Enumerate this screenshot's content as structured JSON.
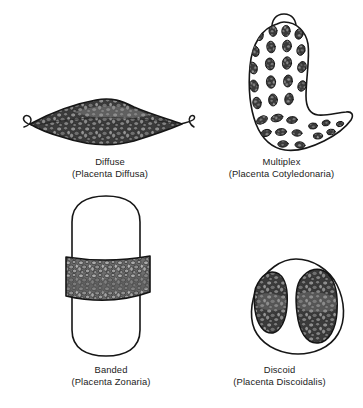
{
  "figure": {
    "title": "",
    "background_color": "#ffffff",
    "line_color": "#1a1a1a",
    "tissue_dark_color": "#2f2f2f",
    "tissue_mid_color": "#6e6e6e",
    "tissue_light_color": "#9a9a9a",
    "panels": [
      {
        "id": "diffuse",
        "name": "Diffuse",
        "latin": "(Placenta Diffusa)",
        "shape": "lens-spindle-fully-villous",
        "villous_coverage": "entire surface"
      },
      {
        "id": "multiplex",
        "name": "Multiplex",
        "latin": "(Placenta Cotyledonaria)",
        "shape": "curved-comma-with-apical-knob",
        "villous_coverage": "multiple scattered cotyledons"
      },
      {
        "id": "banded",
        "name": "Banded",
        "latin": "(Placenta Zonaria)",
        "shape": "vertical-capsule-with-equatorial-band",
        "villous_coverage": "single transverse band"
      },
      {
        "id": "discoid",
        "name": "Discoid",
        "latin": "(Placenta Discoidalis)",
        "shape": "egg-outline-with-two-lateral-discs",
        "villous_coverage": "two opposing discs"
      }
    ]
  }
}
